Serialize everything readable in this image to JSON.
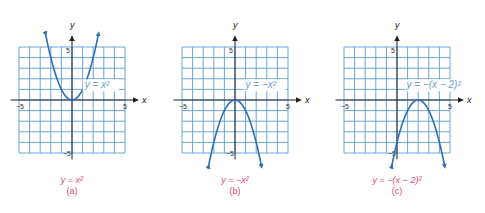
{
  "colors": {
    "grid": "#5b9bd5",
    "curve": "#2f6db5",
    "axis": "#222222",
    "label_text": "#6a9fd0",
    "caption": "#e0457b"
  },
  "axes": {
    "x_label": "x",
    "y_label": "y",
    "tick_min_x": "−5",
    "tick_max_x": "5",
    "tick_max_y": "5",
    "tick_min_y": "−5"
  },
  "panels": [
    {
      "id": "a",
      "curve_label": "y = x²",
      "caption_equation": "y = x²",
      "caption_letter": "(a)"
    },
    {
      "id": "b",
      "curve_label": "y = −x²",
      "caption_equation": "y = −x²",
      "caption_letter": "(b)"
    },
    {
      "id": "c",
      "curve_label": "y = −(x − 2)²",
      "caption_equation": "y = −(x − 2)²",
      "caption_letter": "(c)"
    }
  ],
  "chart_data": [
    {
      "type": "line",
      "title": "y = x²",
      "xlabel": "x",
      "ylabel": "y",
      "xlim": [
        -5,
        5
      ],
      "ylim": [
        -5,
        5
      ],
      "grid": true,
      "x": [
        -2.5,
        -2,
        -1,
        0,
        1,
        2,
        2.5
      ],
      "values": [
        6.25,
        4,
        1,
        0,
        1,
        4,
        6.25
      ],
      "annotation": "(a)"
    },
    {
      "type": "line",
      "title": "y = −x²",
      "xlabel": "x",
      "ylabel": "y",
      "xlim": [
        -5,
        5
      ],
      "ylim": [
        -5,
        5
      ],
      "grid": true,
      "x": [
        -2.5,
        -2,
        -1,
        0,
        1,
        2,
        2.5
      ],
      "values": [
        -6.25,
        -4,
        -1,
        0,
        -1,
        -4,
        -6.25
      ],
      "annotation": "(b)"
    },
    {
      "type": "line",
      "title": "y = −(x − 2)²",
      "xlabel": "x",
      "ylabel": "y",
      "xlim": [
        -5,
        5
      ],
      "ylim": [
        -5,
        5
      ],
      "grid": true,
      "x": [
        -0.5,
        0,
        1,
        2,
        3,
        4,
        4.5
      ],
      "values": [
        -6.25,
        -4,
        -1,
        0,
        -1,
        -4,
        -6.25
      ],
      "annotation": "(c)"
    }
  ]
}
